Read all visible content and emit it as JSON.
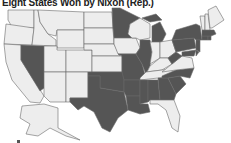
{
  "title": "Eight States Won by Nixon (Rep.)",
  "colors": {
    "shaded": "#555555",
    "unshaded": "#ededed",
    "border": "#6a6a6a"
  },
  "note": "No legend is shown in the image. Shaded states are recorded as they appear; the image does not state what the shading represents beyond the title.",
  "states": {
    "shaded": [
      "NV",
      "TX",
      "OK",
      "AR",
      "LA",
      "MO",
      "MN",
      "IL",
      "MI",
      "MS",
      "AL",
      "GA",
      "SC",
      "NC",
      "WV",
      "PA",
      "NY",
      "NJ",
      "MD",
      "DE",
      "CT",
      "RI",
      "MA",
      "HI"
    ],
    "unshaded": [
      "WA",
      "OR",
      "CA",
      "ID",
      "MT",
      "WY",
      "UT",
      "AZ",
      "CO",
      "NM",
      "ND",
      "SD",
      "NE",
      "KS",
      "IA",
      "WI",
      "IN",
      "OH",
      "KY",
      "TN",
      "VA",
      "FL",
      "VT",
      "NH",
      "ME",
      "AK"
    ]
  }
}
